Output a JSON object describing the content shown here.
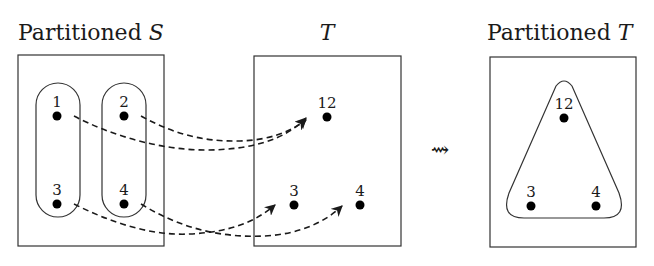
{
  "panels": {
    "partitioned_s": {
      "title_prefix": "Partitioned ",
      "title_var": "S",
      "points": [
        {
          "label": "1"
        },
        {
          "label": "2"
        },
        {
          "label": "3"
        },
        {
          "label": "4"
        }
      ],
      "blocks": [
        [
          "1",
          "3"
        ],
        [
          "2",
          "4"
        ]
      ]
    },
    "t": {
      "title_var": "T",
      "points": [
        {
          "label": "12"
        },
        {
          "label": "3"
        },
        {
          "label": "4"
        }
      ]
    },
    "partitioned_t": {
      "title_prefix": "Partitioned ",
      "title_var": "T",
      "points": [
        {
          "label": "12"
        },
        {
          "label": "3"
        },
        {
          "label": "4"
        }
      ],
      "blocks": [
        [
          "12",
          "3",
          "4"
        ]
      ]
    }
  },
  "mappings": [
    {
      "from": "1",
      "to": "12"
    },
    {
      "from": "2",
      "to": "12"
    },
    {
      "from": "3",
      "to": "3"
    },
    {
      "from": "4",
      "to": "4"
    }
  ],
  "transition_symbol": "⇝"
}
